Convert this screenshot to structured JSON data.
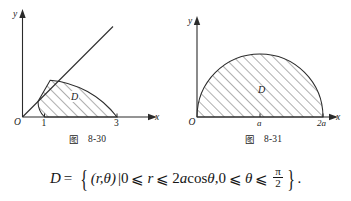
{
  "figures": [
    {
      "name": "figure-8-30",
      "caption_cjk": "图",
      "caption_number": "8-30",
      "axis": {
        "x_label": "x",
        "y_label": "y",
        "origin_label": "O"
      },
      "x_ticks": [
        "1",
        "3"
      ],
      "region_label": "D",
      "description": "annular sector between radius 1 and radius 3 bounded by a ray at 45 degrees and the x-axis, hatched"
    },
    {
      "name": "figure-8-31",
      "caption_cjk": "图",
      "caption_number": "8-31",
      "axis": {
        "x_label": "x",
        "y_label": "y",
        "origin_label": "O"
      },
      "x_ticks": [
        "a",
        "2a"
      ],
      "region_label": "D",
      "description": "upper half disk from 0 to 2a centred at a, hatched"
    }
  ],
  "formula": {
    "lhs": "D",
    "equals": "=",
    "brace_open": "{",
    "pair": "(r,θ)",
    "bar": "|",
    "cond1_lower": "0",
    "le1": "⩽",
    "cond1_var": "r",
    "le2": "⩽",
    "cond1_upper_num": "2",
    "cond1_upper_a": "a",
    "cond1_upper_fn": "cos",
    "cond1_upper_theta": "θ",
    "comma": ",",
    "cond2_lower": "0",
    "le3": "⩽",
    "cond2_var": "θ",
    "le4": "⩽",
    "frac_num": "π",
    "frac_den": "2",
    "brace_close": "}",
    "period": "."
  },
  "colors": {
    "ink": "#1b1b1b",
    "hatch": "#5a5a5a",
    "background": "#ffffff"
  }
}
